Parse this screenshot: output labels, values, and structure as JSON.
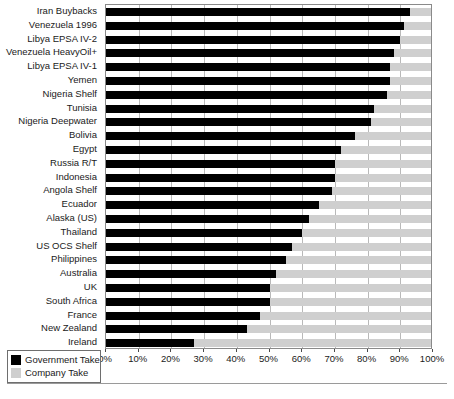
{
  "chart_data": {
    "type": "bar",
    "orientation": "horizontal",
    "stacked": true,
    "title": "",
    "subtitle": "",
    "xlabel": "",
    "ylabel": "",
    "xlim": [
      0,
      100
    ],
    "xunit": "%",
    "grid": true,
    "legend_position": "bottom-left",
    "xticks": [
      "0%",
      "10%",
      "20%",
      "30%",
      "40%",
      "50%",
      "60%",
      "70%",
      "80%",
      "90%",
      "100%"
    ],
    "xtick_values": [
      0,
      10,
      20,
      30,
      40,
      50,
      60,
      70,
      80,
      90,
      100
    ],
    "categories": [
      "Iran Buybacks",
      "Venezuela 1996",
      "Libya EPSA IV-2",
      "Venezuela HeavyOil+",
      "Libya EPSA IV-1",
      "Yemen",
      "Nigeria Shelf",
      "Tunisia",
      "Nigeria Deepwater",
      "Bolivia",
      "Egypt",
      "Russia R/T",
      "Indonesia",
      "Angola Shelf",
      "Ecuador",
      "Alaska (US)",
      "Thailand",
      "US OCS Shelf",
      "Philippines",
      "Australia",
      "UK",
      "South Africa",
      "France",
      "New Zealand",
      "Ireland"
    ],
    "series": [
      {
        "name": "Government Take",
        "color": "#000000",
        "values": [
          93,
          91,
          90,
          88,
          87,
          87,
          86,
          82,
          81,
          76,
          72,
          70,
          70,
          69,
          65,
          62,
          60,
          57,
          55,
          52,
          50,
          50,
          47,
          43,
          27
        ]
      },
      {
        "name": "Company Take",
        "color": "#cfcfcf",
        "values": [
          7,
          9,
          10,
          12,
          13,
          13,
          14,
          18,
          19,
          24,
          28,
          30,
          30,
          31,
          35,
          38,
          40,
          43,
          45,
          48,
          50,
          50,
          53,
          57,
          73
        ]
      }
    ]
  },
  "legend": {
    "items": [
      {
        "label": "Government Take",
        "swatch": "gov"
      },
      {
        "label": "Company Take",
        "swatch": "com"
      }
    ]
  }
}
